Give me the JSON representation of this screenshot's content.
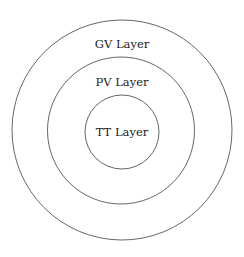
{
  "diagram": {
    "type": "concentric-circles",
    "stroke_color": "#555555",
    "text_color": "#222222",
    "background": "#ffffff",
    "layers": [
      {
        "id": "gv",
        "label": "GV Layer",
        "cx": 122,
        "cy": 130,
        "r": 110,
        "label_y": 48
      },
      {
        "id": "pv",
        "label": "PV Layer",
        "cx": 121,
        "cy": 130.5,
        "r": 73.5,
        "label_y": 86
      },
      {
        "id": "tt",
        "label": "TT Layer",
        "cx": 122,
        "cy": 132,
        "r": 37,
        "label_y": 136
      }
    ]
  }
}
